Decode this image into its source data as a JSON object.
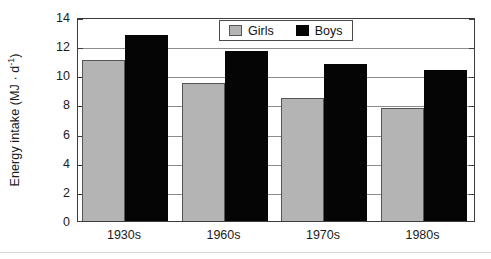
{
  "chart_data": {
    "type": "bar",
    "title": "",
    "subtitle": "",
    "xlabel": "",
    "ylabel": "Energy intake (MJ · d",
    "ylabel_superscript": "-1",
    "ylabel_suffix": ")",
    "categories": [
      "1930s",
      "1960s",
      "1970s",
      "1980s"
    ],
    "series": [
      {
        "name": "Girls",
        "color": "#b4b4b4",
        "values": [
          11.05,
          9.5,
          8.45,
          7.75
        ]
      },
      {
        "name": "Boys",
        "color": "#050505",
        "values": [
          12.75,
          11.65,
          10.8,
          10.35
        ]
      }
    ],
    "ylim": [
      0,
      14
    ],
    "ytick_values": [
      0,
      2,
      4,
      6,
      8,
      10,
      12,
      14
    ],
    "ytick_labels": [
      "0",
      "2",
      "4",
      "6",
      "8",
      "10",
      "12",
      "14"
    ],
    "grid": true,
    "grid_axis": "y",
    "legend_position": "top-center",
    "legend_entries": [
      "Girls",
      "Boys"
    ]
  },
  "legend": {
    "girls_label": "Girls",
    "boys_label": "Boys"
  },
  "axes": {
    "y_title_main": "Energy intake (MJ · d",
    "y_title_sup": "-1",
    "y_title_end": ")"
  }
}
